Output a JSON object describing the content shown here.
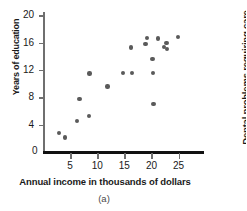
{
  "chart_data": {
    "type": "scatter",
    "title": "",
    "caption": "(a)",
    "xlabel": "Annual income in thousands of dollars",
    "ylabel": "Years of education",
    "xlim": [
      0,
      29.5
    ],
    "ylim": [
      0,
      20.5
    ],
    "xticks": [
      5,
      10,
      15,
      20,
      25
    ],
    "yticks": [
      4,
      8,
      12,
      16,
      20
    ],
    "origin_label": "0",
    "grid": false,
    "legend": null,
    "point_color": "#5a5a5a",
    "axis_color": "#6f6f6f",
    "baseline_color": "#111111",
    "points": [
      {
        "x": 3.0,
        "y": 2.8
      },
      {
        "x": 4.0,
        "y": 2.1
      },
      {
        "x": 6.3,
        "y": 4.5
      },
      {
        "x": 6.7,
        "y": 7.8
      },
      {
        "x": 8.5,
        "y": 5.3
      },
      {
        "x": 8.6,
        "y": 11.5
      },
      {
        "x": 11.9,
        "y": 9.6
      },
      {
        "x": 14.7,
        "y": 11.6
      },
      {
        "x": 16.2,
        "y": 15.3
      },
      {
        "x": 16.4,
        "y": 11.6
      },
      {
        "x": 18.9,
        "y": 15.8
      },
      {
        "x": 19.2,
        "y": 16.7
      },
      {
        "x": 20.2,
        "y": 13.6
      },
      {
        "x": 20.3,
        "y": 11.6
      },
      {
        "x": 20.4,
        "y": 7.0
      },
      {
        "x": 21.2,
        "y": 16.6
      },
      {
        "x": 22.3,
        "y": 15.4
      },
      {
        "x": 22.8,
        "y": 16.0
      },
      {
        "x": 22.9,
        "y": 15.1
      },
      {
        "x": 24.9,
        "y": 16.8
      }
    ]
  },
  "neighbor_figure": {
    "ylabel": "Dental problems requiring care"
  }
}
